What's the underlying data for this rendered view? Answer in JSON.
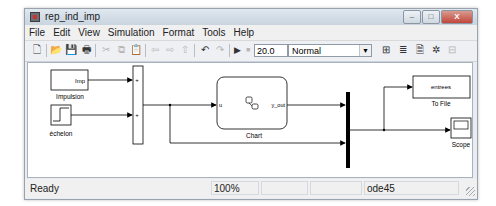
{
  "window": {
    "title": "rep_ind_imp",
    "controls": {
      "minimize": "–",
      "maximize": "□",
      "close": "X"
    }
  },
  "menubar": {
    "items": [
      {
        "label": "File"
      },
      {
        "label": "Edit"
      },
      {
        "label": "View"
      },
      {
        "label": "Simulation"
      },
      {
        "label": "Format"
      },
      {
        "label": "Tools"
      },
      {
        "label": "Help"
      }
    ]
  },
  "toolbar": {
    "icons": [
      {
        "name": "new-model-icon",
        "glyph": "🗋",
        "enabled": true
      },
      {
        "name": "open-icon",
        "glyph": "📂",
        "enabled": true
      },
      {
        "name": "save-icon",
        "glyph": "💾",
        "enabled": true
      },
      {
        "name": "print-icon",
        "glyph": "🖶",
        "enabled": true
      },
      {
        "name": "cut-icon",
        "glyph": "✂",
        "enabled": false
      },
      {
        "name": "copy-icon",
        "glyph": "⧉",
        "enabled": false
      },
      {
        "name": "paste-icon",
        "glyph": "📋",
        "enabled": false
      },
      {
        "name": "back-icon",
        "glyph": "⇦",
        "enabled": false
      },
      {
        "name": "forward-icon",
        "glyph": "⇨",
        "enabled": false
      },
      {
        "name": "up-icon",
        "glyph": "⇧",
        "enabled": false
      },
      {
        "name": "undo-icon",
        "glyph": "↶",
        "enabled": true
      },
      {
        "name": "redo-icon",
        "glyph": "↷",
        "enabled": false
      },
      {
        "name": "start-simulation-icon",
        "glyph": "▶",
        "enabled": true
      },
      {
        "name": "stop-simulation-icon",
        "glyph": "■",
        "enabled": false
      }
    ],
    "stop_time": "20.0",
    "simulation_mode": "Normal",
    "right_icons": [
      {
        "name": "build-icon",
        "glyph": "⊞"
      },
      {
        "name": "library-browser-icon",
        "glyph": "≣"
      },
      {
        "name": "model-explorer-icon",
        "glyph": "🗎"
      },
      {
        "name": "debug-icon",
        "glyph": "✲"
      },
      {
        "name": "toggle-icon",
        "glyph": "⊟"
      }
    ]
  },
  "diagram": {
    "blocks": {
      "impulsion": {
        "label": "Impulsion",
        "inner": "Imp"
      },
      "echelon": {
        "label": "échelon"
      },
      "sum": {
        "port1": "+",
        "port2": "+"
      },
      "chart": {
        "label": "Chart",
        "in_port": "u",
        "out_port": "y_out"
      },
      "to_file": {
        "label": "To File",
        "inner": "entrees"
      },
      "scope": {
        "label": "Scope"
      }
    }
  },
  "statusbar": {
    "status": "Ready",
    "zoom": "100%",
    "field3": "",
    "field4": "",
    "solver": "ode45"
  }
}
